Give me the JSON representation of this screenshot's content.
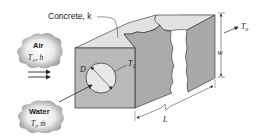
{
  "figure": {
    "material_label": "Concrete, k",
    "air": {
      "title": "Air",
      "params": "T∞, h"
    },
    "water": {
      "title": "Water",
      "params": "Ti, ṁ"
    },
    "labels": {
      "diameter": "D",
      "pipe_surface_temp": "T1",
      "outer_surface_temp": "To",
      "width": "w",
      "length": "L"
    },
    "colors": {
      "front_face": "#b9b9b9",
      "top_face": "#e2e2e2",
      "side_face": "#a9a9a9",
      "pipe": "#e8e8e8",
      "cloud": "#c8c8c8",
      "line": "#2a2a2a"
    }
  }
}
